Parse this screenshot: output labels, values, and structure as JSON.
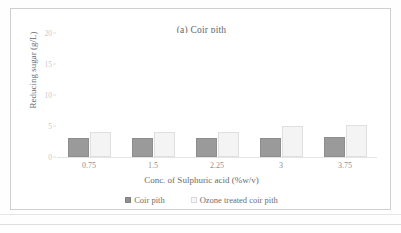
{
  "figure": {
    "caption_label": "(a)"
  },
  "chart_data": {
    "type": "bar",
    "title": "(a) Coir pith",
    "xlabel": "Conc. of Sulphuric acid (%w/v)",
    "ylabel": "Reducing sugar (g/L)",
    "categories": [
      "0.75",
      "1.5",
      "2.25",
      "3",
      "3.75"
    ],
    "ylim": [
      0,
      20
    ],
    "yticks": [
      "0",
      "5",
      "10",
      "15",
      "20"
    ],
    "grid": false,
    "legend_position": "bottom",
    "series": [
      {
        "name": "Coir pith",
        "color": "#9a9a9a",
        "values": [
          3.1,
          3.1,
          3.1,
          3.1,
          3.2
        ]
      },
      {
        "name": "Ozone treated coir pith",
        "color": "#f4f4f4",
        "values": [
          4.0,
          4.1,
          4.0,
          5.0,
          5.2
        ]
      }
    ]
  }
}
